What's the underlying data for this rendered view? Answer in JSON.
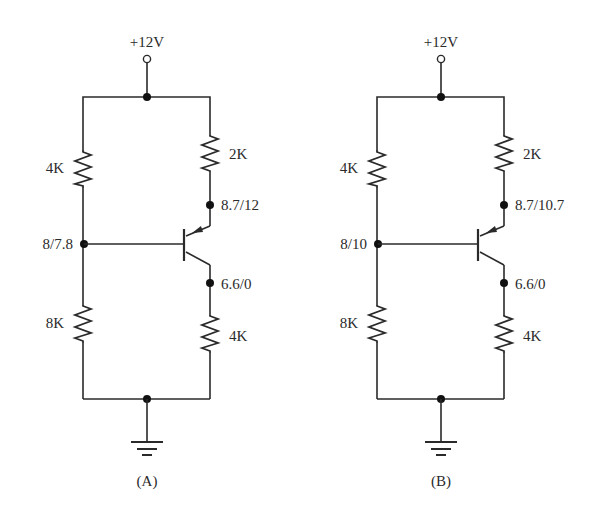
{
  "diagram": {
    "type": "transistor-bias-circuit-comparison",
    "stroke_color": "#2a2a2a",
    "background": "#ffffff",
    "circuits": [
      {
        "id": "A",
        "caption": "(A)",
        "supply_label": "+12V",
        "r_top_left": "4K",
        "r_top_right": "2K",
        "r_bottom_left": "8K",
        "r_bottom_right": "4K",
        "base_node_label": "8/7.8",
        "emitter_node_label": "8.7/12",
        "collector_node_label": "6.6/0",
        "transistor": "PNP"
      },
      {
        "id": "B",
        "caption": "(B)",
        "supply_label": "+12V",
        "r_top_left": "4K",
        "r_top_right": "2K",
        "r_bottom_left": "8K",
        "r_bottom_right": "4K",
        "base_node_label": "8/10",
        "emitter_node_label": "8.7/10.7",
        "collector_node_label": "6.6/0",
        "transistor": "PNP"
      }
    ]
  }
}
